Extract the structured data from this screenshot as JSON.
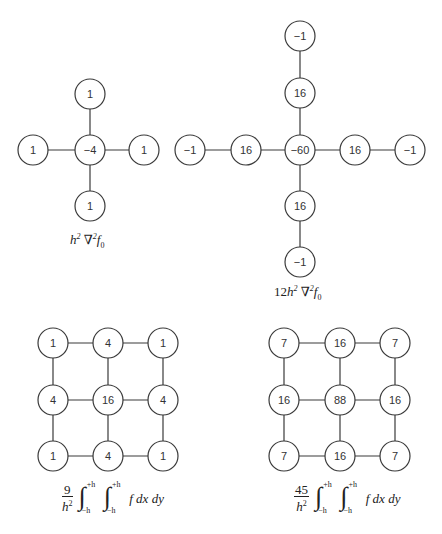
{
  "stencils": [
    {
      "id": "laplacian-5pt",
      "label": {
        "prefix": "h",
        "pow": "2",
        "op": "∇",
        "op_pow": "2",
        "func": "f",
        "sub": "0"
      },
      "nodes": [
        {
          "value": "1",
          "x": 90,
          "y": 94
        },
        {
          "value": "1",
          "x": 33,
          "y": 150
        },
        {
          "value": "−4",
          "x": 90,
          "y": 150
        },
        {
          "value": "1",
          "x": 144,
          "y": 150
        },
        {
          "value": "1",
          "x": 90,
          "y": 206
        }
      ]
    },
    {
      "id": "laplacian-9pt",
      "label": {
        "coef": "12",
        "prefix": "h",
        "pow": "2",
        "op": "∇",
        "op_pow": "2",
        "func": "f",
        "sub": "0"
      },
      "nodes": [
        {
          "value": "−1",
          "x": 300,
          "y": 36
        },
        {
          "value": "16",
          "x": 300,
          "y": 93
        },
        {
          "value": "−1",
          "x": 190,
          "y": 150
        },
        {
          "value": "16",
          "x": 246,
          "y": 150
        },
        {
          "value": "−60",
          "x": 300,
          "y": 150
        },
        {
          "value": "16",
          "x": 355,
          "y": 150
        },
        {
          "value": "−1",
          "x": 410,
          "y": 150
        },
        {
          "value": "16",
          "x": 300,
          "y": 206
        },
        {
          "value": "−1",
          "x": 300,
          "y": 262
        }
      ]
    }
  ],
  "grids": [
    {
      "id": "integration-grid-1",
      "values": [
        [
          "1",
          "4",
          "1"
        ],
        [
          "4",
          "16",
          "4"
        ],
        [
          "1",
          "4",
          "1"
        ]
      ],
      "cols": [
        53,
        108,
        163
      ],
      "rows": [
        343,
        400,
        456
      ],
      "formula": {
        "num": "9",
        "den": "h",
        "den_pow": "2",
        "upper": "+h",
        "lower": "−h",
        "integrand": "f dx dy"
      }
    },
    {
      "id": "integration-grid-2",
      "values": [
        [
          "7",
          "16",
          "7"
        ],
        [
          "16",
          "88",
          "16"
        ],
        [
          "7",
          "16",
          "7"
        ]
      ],
      "cols": [
        284,
        340,
        395
      ],
      "rows": [
        343,
        400,
        456
      ],
      "formula": {
        "num": "45",
        "den": "h",
        "den_pow": "2",
        "upper": "+h",
        "lower": "−h",
        "integrand": "f dx dy"
      }
    }
  ],
  "node_radius": 15
}
